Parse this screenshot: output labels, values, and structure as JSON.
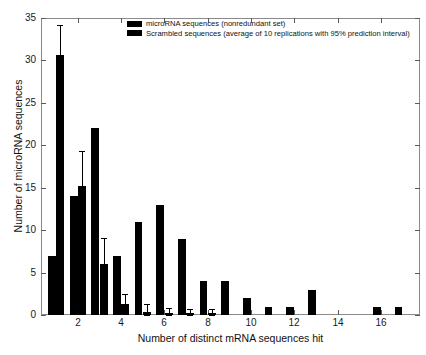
{
  "chart_data": {
    "type": "bar",
    "title": "",
    "xlabel": "Number of distinct mRNA sequences hit",
    "ylabel": "Number of microRNA sequences",
    "xlim": [
      0.3,
      17.8
    ],
    "ylim": [
      0,
      35
    ],
    "xticks": [
      2,
      4,
      6,
      8,
      10,
      12,
      14,
      16
    ],
    "yticks": [
      0,
      5,
      10,
      15,
      20,
      25,
      30,
      35
    ],
    "xticklabels": [
      "2",
      "4",
      "6",
      "8",
      "10",
      "12",
      "14",
      "16"
    ],
    "yticklabels": [
      "0",
      "5",
      "10",
      "15",
      "20",
      "25",
      "30",
      "35"
    ],
    "grid": false,
    "legend_position": "top-center",
    "categories": [
      1,
      2,
      3,
      4,
      5,
      6,
      7,
      8,
      9,
      10,
      11,
      12,
      13,
      14,
      15,
      16,
      17
    ],
    "series": [
      {
        "name": "microRNA sequences (nonredundant set)",
        "color": "#000000",
        "values": [
          7,
          14,
          22,
          7,
          11,
          13,
          9,
          4,
          4,
          2,
          1,
          1,
          3,
          0,
          0,
          1,
          1
        ]
      },
      {
        "name": "Scrambled sequences (average of 10 replications with 95% prediction interval)",
        "color": "#000000",
        "values": [
          30.6,
          15.2,
          6.0,
          1.3,
          0.4,
          0.2,
          0.2,
          0.2,
          0,
          0,
          0,
          0,
          0,
          0,
          0,
          0,
          0
        ],
        "error_low": [
          27.2,
          11.1,
          2.8,
          0.3,
          0.0,
          0.0,
          0.0,
          0.0,
          0,
          0,
          0,
          0,
          0,
          0,
          0,
          0,
          0
        ],
        "error_high": [
          34.2,
          19.3,
          9.1,
          2.5,
          1.3,
          0.8,
          0.7,
          0.7,
          0,
          0,
          0,
          0,
          0,
          0,
          0,
          0,
          0
        ]
      }
    ]
  },
  "legend": {
    "entries": [
      "microRNA sequences (nonredundant set)",
      "Scrambled sequences (average of 10 replications with 95% prediction interval)"
    ]
  }
}
